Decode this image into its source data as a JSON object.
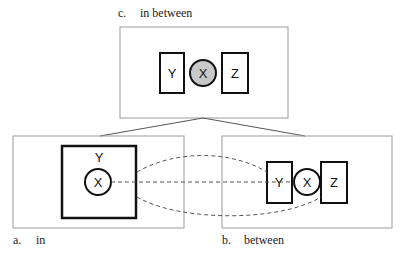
{
  "panels": {
    "c": {
      "letter": "c.",
      "caption": "in between",
      "y_label": "Y",
      "x_label": "X",
      "z_label": "Z"
    },
    "a": {
      "letter": "a.",
      "caption": "in",
      "y_label": "Y",
      "x_label": "X"
    },
    "b": {
      "letter": "b.",
      "caption": "between",
      "y_label": "Y",
      "x_label": "X",
      "z_label": "Z"
    }
  },
  "colors": {
    "frame": "#9a9a9a",
    "stroke": "#111111",
    "x_fill_c": "#c8c8c8",
    "dash": "#555555"
  }
}
